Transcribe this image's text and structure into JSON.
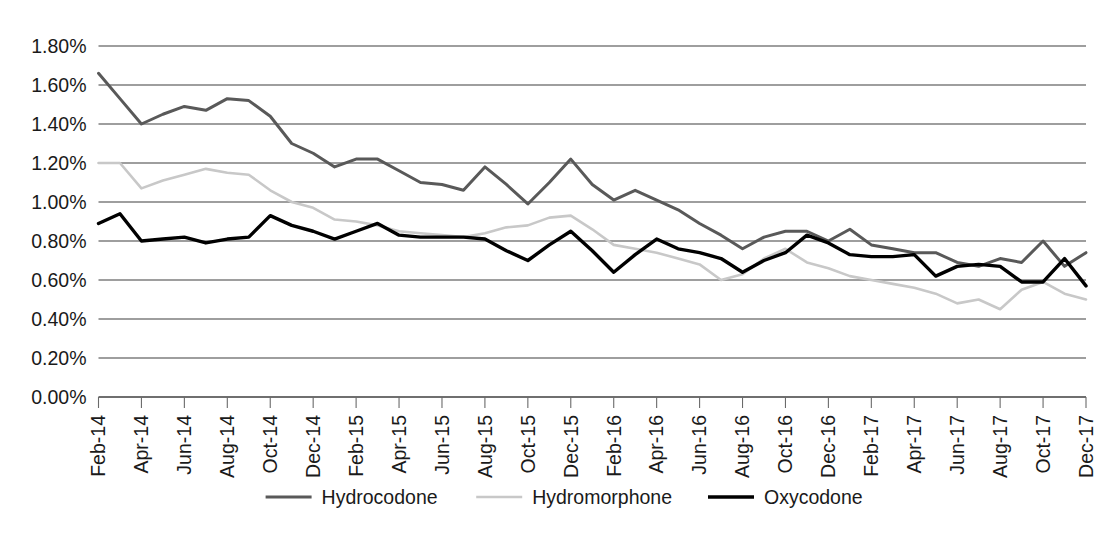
{
  "chart_data": {
    "type": "line",
    "title": "",
    "xlabel": "",
    "ylabel": "",
    "ylim": [
      0,
      1.8
    ],
    "y_unit": "%",
    "grid": true,
    "legend_position": "bottom",
    "y_ticks": [
      "0.00%",
      "0.20%",
      "0.40%",
      "0.60%",
      "0.80%",
      "1.00%",
      "1.20%",
      "1.40%",
      "1.60%",
      "1.80%"
    ],
    "x": [
      "Feb-14",
      "Mar-14",
      "Apr-14",
      "May-14",
      "Jun-14",
      "Jul-14",
      "Aug-14",
      "Sep-14",
      "Oct-14",
      "Nov-14",
      "Dec-14",
      "Jan-15",
      "Feb-15",
      "Mar-15",
      "Apr-15",
      "May-15",
      "Jun-15",
      "Jul-15",
      "Aug-15",
      "Sep-15",
      "Oct-15",
      "Nov-15",
      "Dec-15",
      "Jan-16",
      "Feb-16",
      "Mar-16",
      "Apr-16",
      "May-16",
      "Jun-16",
      "Jul-16",
      "Aug-16",
      "Sep-16",
      "Oct-16",
      "Nov-16",
      "Dec-16",
      "Jan-17",
      "Feb-17",
      "Mar-17",
      "Apr-17",
      "May-17",
      "Jun-17",
      "Jul-17",
      "Aug-17",
      "Sep-17",
      "Oct-17",
      "Nov-17",
      "Dec-17"
    ],
    "x_tick_labels": [
      "Feb-14",
      "Apr-14",
      "Jun-14",
      "Aug-14",
      "Oct-14",
      "Dec-14",
      "Feb-15",
      "Apr-15",
      "Jun-15",
      "Aug-15",
      "Oct-15",
      "Dec-15",
      "Feb-16",
      "Apr-16",
      "Jun-16",
      "Aug-16",
      "Oct-16",
      "Dec-16",
      "Feb-17",
      "Apr-17",
      "Jun-17",
      "Aug-17",
      "Oct-17",
      "Dec-17"
    ],
    "series": [
      {
        "name": "Hydrocodone",
        "color": "#595959",
        "width": 3.0,
        "values": [
          1.66,
          1.53,
          1.4,
          1.45,
          1.49,
          1.47,
          1.53,
          1.52,
          1.44,
          1.3,
          1.25,
          1.18,
          1.22,
          1.22,
          1.16,
          1.1,
          1.09,
          1.06,
          1.18,
          1.09,
          0.99,
          1.1,
          1.22,
          1.09,
          1.01,
          1.06,
          1.01,
          0.96,
          0.89,
          0.83,
          0.76,
          0.82,
          0.85,
          0.85,
          0.8,
          0.86,
          0.78,
          0.76,
          0.74,
          0.74,
          0.69,
          0.67,
          0.71,
          0.69,
          0.8,
          0.67,
          0.74
        ]
      },
      {
        "name": "Hydromorphone",
        "color": "#c8c8c8",
        "width": 2.6,
        "values": [
          1.2,
          1.2,
          1.07,
          1.11,
          1.14,
          1.17,
          1.15,
          1.14,
          1.06,
          1.0,
          0.97,
          0.91,
          0.9,
          0.88,
          0.85,
          0.84,
          0.83,
          0.82,
          0.84,
          0.87,
          0.88,
          0.92,
          0.93,
          0.86,
          0.78,
          0.76,
          0.74,
          0.71,
          0.68,
          0.6,
          0.63,
          0.71,
          0.76,
          0.69,
          0.66,
          0.62,
          0.6,
          0.58,
          0.56,
          0.53,
          0.48,
          0.5,
          0.45,
          0.55,
          0.59,
          0.53,
          0.5
        ]
      },
      {
        "name": "Oxycodone",
        "color": "#000000",
        "width": 3.4,
        "values": [
          0.89,
          0.94,
          0.8,
          0.81,
          0.82,
          0.79,
          0.81,
          0.82,
          0.93,
          0.88,
          0.85,
          0.81,
          0.85,
          0.89,
          0.83,
          0.82,
          0.82,
          0.82,
          0.81,
          0.75,
          0.7,
          0.78,
          0.85,
          0.75,
          0.64,
          0.73,
          0.81,
          0.76,
          0.74,
          0.71,
          0.64,
          0.7,
          0.74,
          0.83,
          0.79,
          0.73,
          0.72,
          0.72,
          0.73,
          0.62,
          0.67,
          0.68,
          0.67,
          0.59,
          0.59,
          0.71,
          0.57
        ]
      }
    ]
  },
  "legend": {
    "items": [
      {
        "label": "Hydrocodone",
        "color": "#595959"
      },
      {
        "label": "Hydromorphone",
        "color": "#c8c8c8"
      },
      {
        "label": "Oxycodone",
        "color": "#000000"
      }
    ]
  },
  "caption": {
    "text": ""
  }
}
